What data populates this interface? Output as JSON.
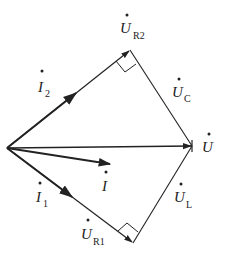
{
  "diagram": {
    "type": "phasor-diagram",
    "origin": [
      7,
      148
    ],
    "vertices": {
      "U_R2_tip": [
        130,
        50
      ],
      "U_tip": [
        192,
        146
      ],
      "U_R1_tip": [
        133,
        243
      ]
    },
    "labels": {
      "U_R2": {
        "main": "U",
        "sub": "R2"
      },
      "U_C": {
        "main": "U",
        "sub": "C"
      },
      "U": {
        "main": "U",
        "sub": ""
      },
      "U_L": {
        "main": "U",
        "sub": "L"
      },
      "U_R1": {
        "main": "U",
        "sub": "R1"
      },
      "I2": {
        "main": "I",
        "sub": "2"
      },
      "I1": {
        "main": "I",
        "sub": "1"
      },
      "I": {
        "main": "I",
        "sub": ""
      }
    },
    "stroke_color": "#222222"
  }
}
